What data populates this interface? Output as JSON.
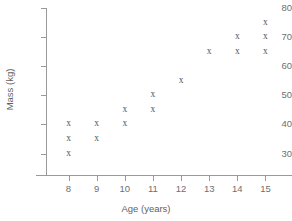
{
  "chart_data": {
    "type": "scatter",
    "title": "",
    "xlabel": "Age (years)",
    "ylabel": "Mass (kg)",
    "xlim": [
      7.2,
      15.8
    ],
    "ylim": [
      24,
      80
    ],
    "grid": false,
    "legend": null,
    "marker_symbol": "x",
    "marker_color": "#555555",
    "axis_color": "#9a9a9a",
    "x_ticks": [
      8,
      9,
      10,
      11,
      12,
      13,
      14,
      15
    ],
    "y_ticks": [
      30,
      40,
      50,
      60,
      70,
      80
    ],
    "x_ticklabels": [
      "8",
      "9",
      "10",
      "11",
      "12",
      "13",
      "14",
      "15"
    ],
    "y_ticklabels": [
      "30",
      "40",
      "50",
      "60",
      "70",
      "80"
    ],
    "points": [
      {
        "x": 8,
        "y": 40
      },
      {
        "x": 8,
        "y": 35
      },
      {
        "x": 8,
        "y": 30
      },
      {
        "x": 9,
        "y": 40
      },
      {
        "x": 9,
        "y": 35
      },
      {
        "x": 10,
        "y": 45
      },
      {
        "x": 10,
        "y": 40
      },
      {
        "x": 11,
        "y": 50
      },
      {
        "x": 11,
        "y": 45
      },
      {
        "x": 12,
        "y": 55
      },
      {
        "x": 13,
        "y": 65
      },
      {
        "x": 14,
        "y": 70
      },
      {
        "x": 14,
        "y": 65
      },
      {
        "x": 15,
        "y": 75
      },
      {
        "x": 15,
        "y": 70
      },
      {
        "x": 15,
        "y": 65
      }
    ]
  }
}
